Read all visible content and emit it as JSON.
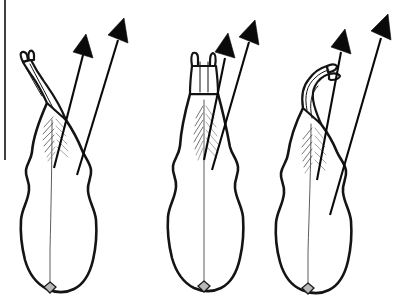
{
  "figure": {
    "kind": "scientific line drawing",
    "background_color": "#ffffff",
    "ink_color": "#141414",
    "arrow_color": "#0a0a0a",
    "node_color": "#b9b9b9",
    "hatch_color": "#6a6a6a",
    "canvas": {
      "width": 403,
      "height": 307
    },
    "panel_count": 3,
    "arrows_per_panel": 2,
    "page_rule": {
      "label": "left page border line",
      "x": 5,
      "y_start": 0,
      "y_end": 160
    },
    "panels": [
      {
        "id": "panel-left",
        "label": "Stage 1 — apex reflexed to the left",
        "apex_state": "forked tip curved left, two prongs",
        "body_label": "lobed body with median line",
        "node_label": "basal node",
        "arrows": [
          {
            "name": "inner-arrow",
            "angle_deg": 62,
            "length_px": 170
          },
          {
            "name": "outer-arrow",
            "angle_deg": 68,
            "length_px": 210
          }
        ]
      },
      {
        "id": "panel-middle",
        "label": "Stage 2 — apex erect and symmetrical",
        "apex_state": "forked tip upright, two prongs",
        "body_label": "lobed body with median line",
        "node_label": "basal node",
        "arrows": [
          {
            "name": "inner-arrow",
            "angle_deg": 62,
            "length_px": 170
          },
          {
            "name": "outer-arrow",
            "angle_deg": 68,
            "length_px": 215
          }
        ]
      },
      {
        "id": "panel-right",
        "label": "Stage 3 — apex reflexed to the right",
        "apex_state": "forked tip curved right, two prongs",
        "body_label": "lobed body with median line",
        "node_label": "basal node",
        "arrows": [
          {
            "name": "inner-arrow",
            "angle_deg": 68,
            "length_px": 165
          },
          {
            "name": "outer-arrow",
            "angle_deg": 73,
            "length_px": 235
          }
        ]
      }
    ]
  }
}
